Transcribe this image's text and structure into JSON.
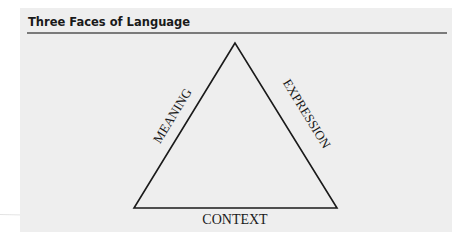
{
  "figure": {
    "title": "Three Faces of Language",
    "colors": {
      "panel_background": "#eeeeee",
      "line": "#1a1a1a",
      "rule": "#7a7a7a"
    },
    "triangle": {
      "vertices": {
        "apex": [
          235,
          43
        ],
        "bottom_left": [
          134,
          208
        ],
        "bottom_right": [
          337,
          208
        ]
      },
      "labels": {
        "left_side": "MEANING",
        "right_side": "EXPRESSION",
        "base": "CONTEXT"
      }
    }
  }
}
